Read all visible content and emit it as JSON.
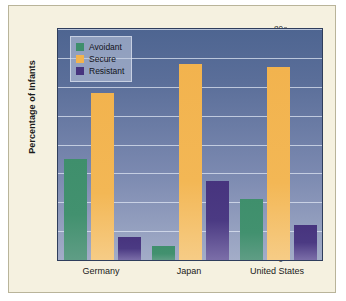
{
  "chart_data": {
    "type": "bar",
    "title": "",
    "xlabel": "",
    "ylabel": "Percentage of Infants",
    "categories": [
      "Germany",
      "Japan",
      "United States"
    ],
    "series": [
      {
        "name": "Avoidant",
        "color": "#3f8f6c",
        "values": [
          35,
          5,
          21
        ]
      },
      {
        "name": "Secure",
        "color": "#f2b34e",
        "values": [
          58,
          68,
          67
        ]
      },
      {
        "name": "Resistant",
        "color": "#47347e",
        "values": [
          8,
          27.5,
          12
        ]
      }
    ],
    "ylim": [
      0,
      80
    ],
    "ytick_step": 10,
    "yticks": [
      "0",
      "10",
      "20",
      "30",
      "40",
      "50",
      "60",
      "70",
      "80"
    ],
    "grid": true,
    "legend_position": "top-left",
    "plot_background": "#5a6e99",
    "figure_background": "#f5f1e0"
  }
}
